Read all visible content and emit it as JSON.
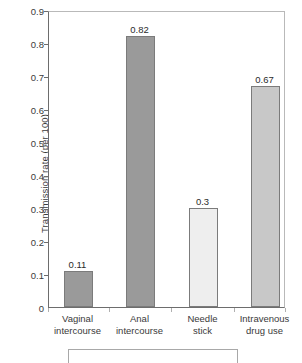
{
  "chart_data": {
    "type": "bar",
    "title": "",
    "xlabel": "",
    "ylabel": "Transmission rate (per 100)",
    "categories": [
      "Vaginal intercourse",
      "Anal intercourse",
      "Needle stick",
      "Intravenous drug use"
    ],
    "category_lines": [
      [
        "Vaginal",
        "intercourse"
      ],
      [
        "Anal",
        "intercourse"
      ],
      [
        "Needle",
        "stick"
      ],
      [
        "Intravenous",
        "drug use"
      ]
    ],
    "values": [
      0.11,
      0.82,
      0.3,
      0.67
    ],
    "value_labels": [
      "0.11",
      "0.82",
      "0.3",
      "0.67"
    ],
    "bar_colors": [
      "#9a9a9a",
      "#9a9a9a",
      "#eeeeee",
      "#c8c8c8"
    ],
    "bar_border_color": "#7b7b7b",
    "ylim": [
      0,
      0.9
    ],
    "ytick_labels": [
      "0.9",
      "0.8",
      "0.7",
      "0.6",
      "0.5",
      "0.4",
      "0.3",
      "0.2",
      "0.1",
      "0"
    ],
    "ytick_values": [
      0.9,
      0.8,
      0.7,
      0.6,
      0.5,
      0.4,
      0.3,
      0.2,
      0.1,
      0
    ],
    "grid": false,
    "legend": false
  },
  "caption_box": {
    "text": ""
  }
}
